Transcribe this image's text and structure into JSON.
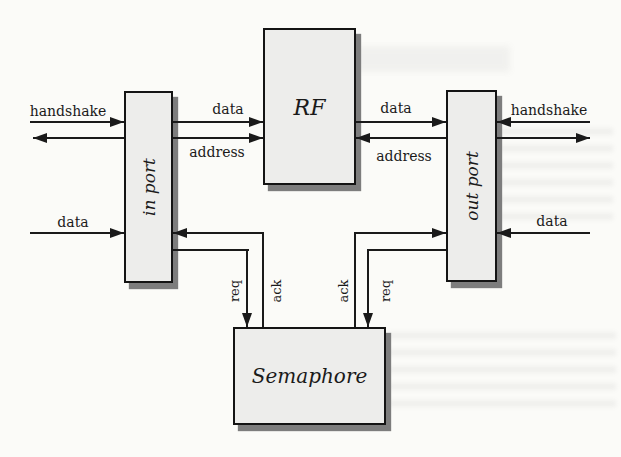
{
  "diagram": {
    "nodes": {
      "in_port": {
        "label": "in port"
      },
      "rf": {
        "label": "RF"
      },
      "out_port": {
        "label": "out port"
      },
      "semaphore": {
        "label": "Semaphore"
      }
    },
    "labels": {
      "handshake_left": "handshake",
      "data_inport_to_rf": "data",
      "address_inport_to_rf": "address",
      "data_rf_to_outport": "data",
      "address_outport_to_rf": "address",
      "handshake_right": "handshake",
      "data_external_left": "data",
      "data_external_right": "data",
      "req_left": "req",
      "ack_left": "ack",
      "ack_right": "ack",
      "req_right": "req"
    },
    "connections": [
      {
        "from": "external-left",
        "to": "in port",
        "signal": "handshake",
        "direction": "bidirectional"
      },
      {
        "from": "external-left",
        "to": "in port",
        "signal": "data",
        "direction": "into in port"
      },
      {
        "from": "in port",
        "to": "RF",
        "signal": "data",
        "direction": "into RF"
      },
      {
        "from": "in port",
        "to": "RF",
        "signal": "address",
        "direction": "into RF"
      },
      {
        "from": "RF",
        "to": "out port",
        "signal": "data",
        "direction": "into out port"
      },
      {
        "from": "out port",
        "to": "RF",
        "signal": "address",
        "direction": "into RF"
      },
      {
        "from": "external-right",
        "to": "out port",
        "signal": "handshake",
        "direction": "bidirectional"
      },
      {
        "from": "external-right",
        "to": "out port",
        "signal": "data",
        "direction": "into out port"
      },
      {
        "from": "in port",
        "to": "Semaphore",
        "signal": "req",
        "direction": "into Semaphore"
      },
      {
        "from": "Semaphore",
        "to": "in port",
        "signal": "ack",
        "direction": "into in port"
      },
      {
        "from": "out port",
        "to": "Semaphore",
        "signal": "req",
        "direction": "into Semaphore"
      },
      {
        "from": "Semaphore",
        "to": "out port",
        "signal": "ack",
        "direction": "into out port"
      }
    ],
    "colors": {
      "line": "#1a1a1a",
      "box_fill": "#ededeb",
      "box_border": "#141414",
      "shadow": "#7d7d7d",
      "background": "#fbfbf8"
    }
  }
}
